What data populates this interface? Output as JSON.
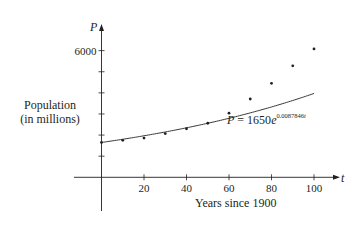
{
  "chart_data": {
    "type": "scatter",
    "title": "",
    "xlabel": "Years since 1900",
    "ylabel": "Population (in millions)",
    "x_axis_variable": "t",
    "y_axis_variable": "P",
    "xlim": [
      0,
      100
    ],
    "ylim": [
      0,
      6000
    ],
    "x_ticks": [
      20,
      40,
      60,
      80,
      100
    ],
    "y_ticks": [
      1000,
      2000,
      3000,
      4000,
      5000,
      6000
    ],
    "y_tick_labels_shown": [
      "6000"
    ],
    "grid": false,
    "series": [
      {
        "name": "Population data",
        "type": "scatter",
        "x": [
          0,
          10,
          20,
          30,
          40,
          50,
          60,
          70,
          80,
          90,
          100
        ],
        "values": [
          1650,
          1750,
          1860,
          2070,
          2300,
          2560,
          3040,
          3710,
          4450,
          5280,
          6080
        ]
      },
      {
        "name": "Exponential model",
        "type": "line",
        "formula": "P = 1650e^(0.0087846t)",
        "a": 1650,
        "k": 0.0087846,
        "x_range": [
          0,
          100
        ]
      }
    ],
    "annotations": [
      {
        "text": "P = 1650e^0.0087846t",
        "position": "below curve near t=60-100"
      }
    ]
  },
  "labels": {
    "y_var": "P",
    "x_var": "t",
    "y_tick_6000": "6000",
    "x_ticks": [
      "20",
      "40",
      "60",
      "80",
      "100"
    ],
    "ylabel_line1": "Population",
    "ylabel_line2": "(in millions)",
    "xlabel": "Years since 1900",
    "eq_lhs": "P",
    "eq_mid": " = 1650",
    "eq_e": "e",
    "eq_exp": "0.0087846",
    "eq_exp_var": "t"
  },
  "colors": {
    "ink": "#231f20",
    "curve": "#3a3a3a"
  }
}
